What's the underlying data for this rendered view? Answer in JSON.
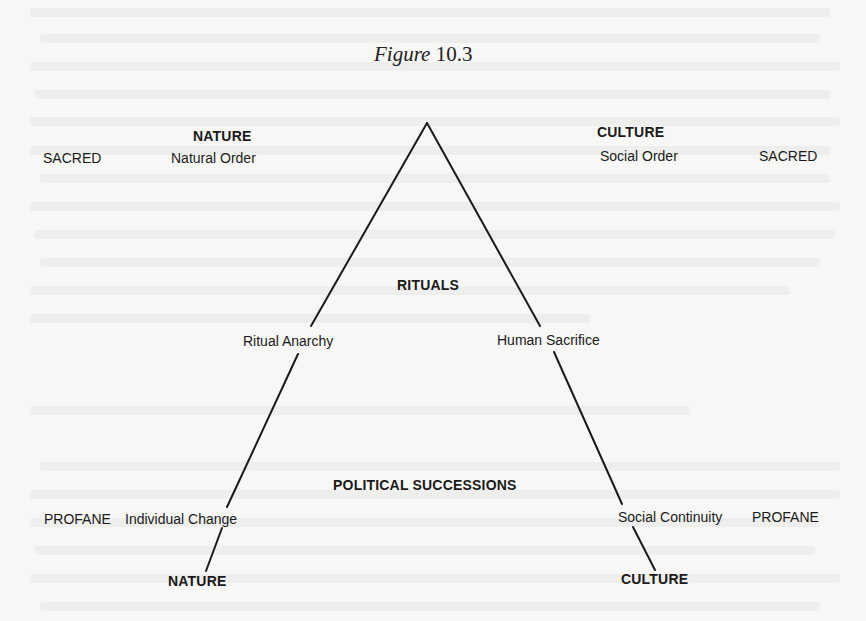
{
  "figure": {
    "caption_word": "Figure",
    "caption_number": "10.3"
  },
  "top_left": {
    "heading": "NATURE",
    "sacred": "SACRED",
    "order": "Natural Order"
  },
  "top_right": {
    "heading": "CULTURE",
    "order": "Social Order",
    "sacred": "SACRED"
  },
  "middle": {
    "heading": "RITUALS",
    "left_label": "Ritual Anarchy",
    "right_label": "Human Sacrifice"
  },
  "lower": {
    "heading": "POLITICAL SUCCESSIONS",
    "left_profane": "PROFANE",
    "left_label": "Individual Change",
    "right_label": "Social Continuity",
    "right_profane": "PROFANE"
  },
  "bottom": {
    "left_heading": "NATURE",
    "right_heading": "CULTURE"
  },
  "lines": {
    "color": "#1a1a1a",
    "apex": [
      427,
      123
    ],
    "left_end": [
      206,
      581
    ],
    "right_end": [
      655,
      580
    ]
  }
}
